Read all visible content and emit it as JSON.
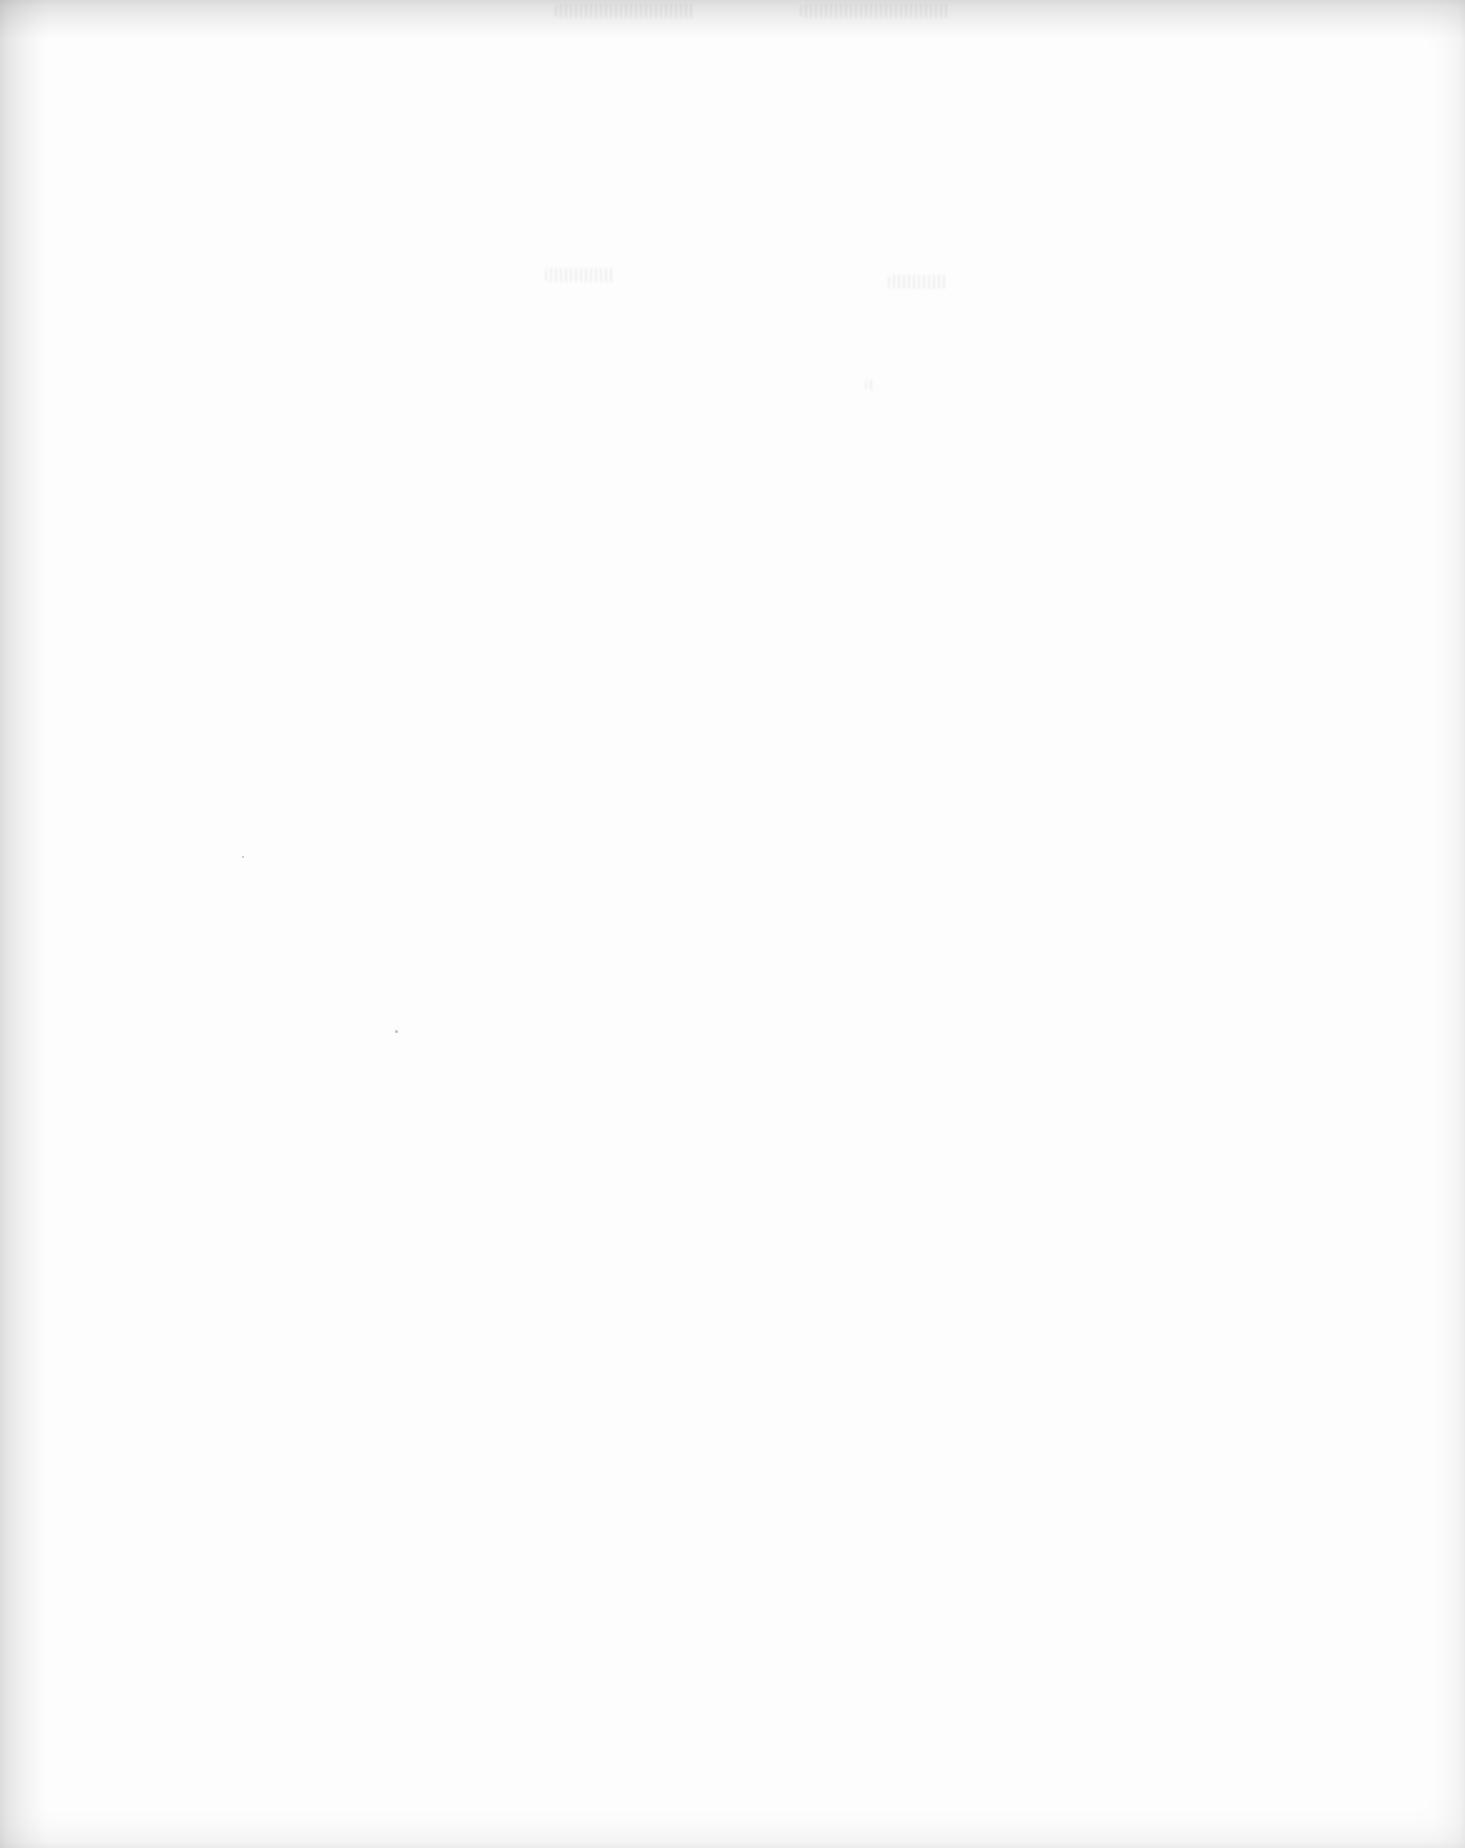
{
  "document": {
    "type": "blank-scanned-page",
    "visible_text": [],
    "background_color": "#fdfdfd",
    "edge_shadow_color": "#e6e6e6"
  }
}
